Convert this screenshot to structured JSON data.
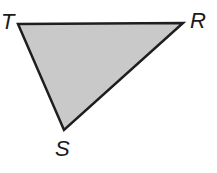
{
  "diagram": {
    "type": "triangle",
    "fill_color": "#c9c9c9",
    "stroke_color": "#1e1e1e",
    "vertices": [
      {
        "name": "T",
        "label": "T",
        "x": 18,
        "y": 24,
        "label_x": 1,
        "label_y": 29
      },
      {
        "name": "R",
        "label": "R",
        "x": 183,
        "y": 23,
        "label_x": 190,
        "label_y": 28
      },
      {
        "name": "S",
        "label": "S",
        "x": 64,
        "y": 130,
        "label_x": 55,
        "label_y": 156
      }
    ]
  }
}
